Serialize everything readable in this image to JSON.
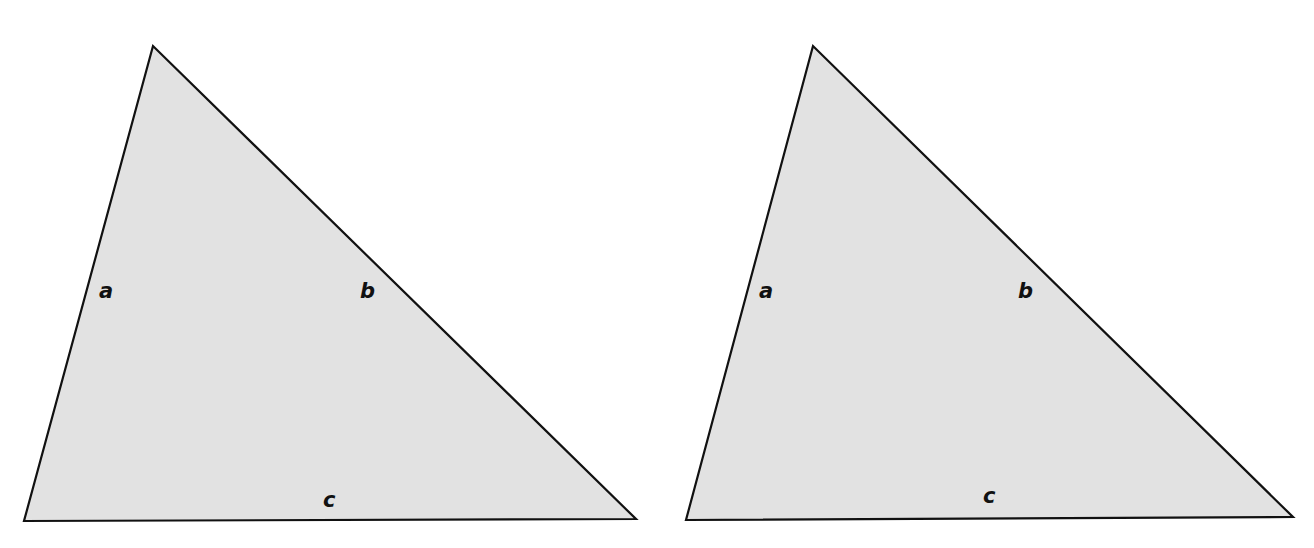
{
  "colors": {
    "background": "#ffffff",
    "fill": "#e2e2e2",
    "stroke": "#111111",
    "label": "#111111"
  },
  "triangles": [
    {
      "id": "left",
      "points": "153,46 24,521 636,519",
      "labels": [
        {
          "text": "a",
          "x": 99,
          "y": 298
        },
        {
          "text": "b",
          "x": 360,
          "y": 298
        },
        {
          "text": "c",
          "x": 323,
          "y": 507
        }
      ]
    },
    {
      "id": "right",
      "points": "813,46 686,520 1293,517",
      "labels": [
        {
          "text": "a",
          "x": 759,
          "y": 298
        },
        {
          "text": "b",
          "x": 1018,
          "y": 298
        },
        {
          "text": "c",
          "x": 983,
          "y": 503
        }
      ]
    }
  ]
}
